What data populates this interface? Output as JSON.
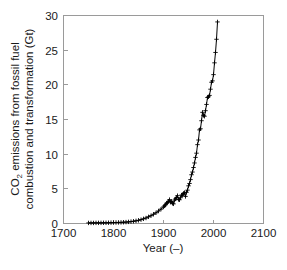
{
  "figure": {
    "background_color": "#ffffff",
    "axis_color": "#9a9a9a",
    "data_color": "#000000",
    "marker_symbol": "plus"
  },
  "chart_data": {
    "type": "line",
    "title": "",
    "subtitle": "",
    "xlabel": "Year (–)",
    "ylabel": "CO2 emissions from fossil fuel combustion and transformation (Gt)",
    "ylabel_line1": "CO",
    "ylabel_line1_sub": "2",
    "ylabel_line1_rest": " emissions from fossil fuel",
    "ylabel_line2": "combustion and transformation (Gt)",
    "xlim": [
      1700,
      2100
    ],
    "ylim": [
      0,
      30
    ],
    "xticks": [
      1700,
      1800,
      1900,
      2000,
      2100
    ],
    "xticklabels": [
      "1700",
      "1800",
      "1900",
      "2000",
      "2100"
    ],
    "yticks": [
      0,
      5,
      10,
      15,
      20,
      25,
      30
    ],
    "yticklabels": [
      "0",
      "5",
      "10",
      "15",
      "20",
      "25",
      "30"
    ],
    "grid": false,
    "legend": null,
    "marker": "+",
    "series": [
      {
        "name": "CO2 emissions from fossil fuel combustion and transformation",
        "x": [
          1751,
          1756,
          1761,
          1766,
          1771,
          1776,
          1781,
          1786,
          1791,
          1796,
          1801,
          1806,
          1811,
          1816,
          1821,
          1826,
          1831,
          1836,
          1841,
          1846,
          1851,
          1856,
          1861,
          1866,
          1871,
          1876,
          1881,
          1886,
          1891,
          1896,
          1901,
          1903,
          1905,
          1907,
          1909,
          1911,
          1913,
          1915,
          1917,
          1919,
          1921,
          1923,
          1925,
          1927,
          1929,
          1931,
          1933,
          1935,
          1937,
          1939,
          1941,
          1943,
          1945,
          1947,
          1949,
          1951,
          1953,
          1955,
          1957,
          1959,
          1961,
          1963,
          1965,
          1967,
          1969,
          1971,
          1973,
          1975,
          1977,
          1979,
          1981,
          1983,
          1985,
          1987,
          1989,
          1991,
          1993,
          1995,
          1997,
          1999,
          2001,
          2003,
          2005,
          2007,
          2009
        ],
        "y": [
          0.01,
          0.01,
          0.01,
          0.02,
          0.02,
          0.02,
          0.03,
          0.03,
          0.04,
          0.05,
          0.06,
          0.07,
          0.08,
          0.09,
          0.11,
          0.13,
          0.16,
          0.2,
          0.25,
          0.31,
          0.39,
          0.48,
          0.6,
          0.72,
          0.89,
          1.05,
          1.26,
          1.47,
          1.73,
          2.0,
          2.32,
          2.47,
          2.62,
          2.85,
          2.93,
          3.13,
          3.37,
          3.0,
          3.1,
          2.84,
          2.76,
          3.3,
          3.47,
          3.67,
          3.94,
          3.4,
          3.35,
          3.64,
          4.02,
          4.02,
          4.27,
          4.38,
          3.83,
          4.43,
          4.74,
          5.36,
          5.7,
          6.26,
          6.96,
          7.35,
          8.0,
          8.66,
          9.46,
          10.07,
          11.3,
          11.97,
          13.43,
          13.59,
          14.75,
          15.96,
          15.52,
          15.4,
          16.2,
          17.1,
          18.1,
          18.2,
          18.4,
          19.3,
          20.3,
          20.5,
          21.4,
          23.1,
          24.6,
          26.5,
          29.0
        ]
      }
    ]
  },
  "axes_geometry": {
    "left_px": 63,
    "right_px": 263,
    "top_px": 15,
    "bottom_px": 223
  }
}
